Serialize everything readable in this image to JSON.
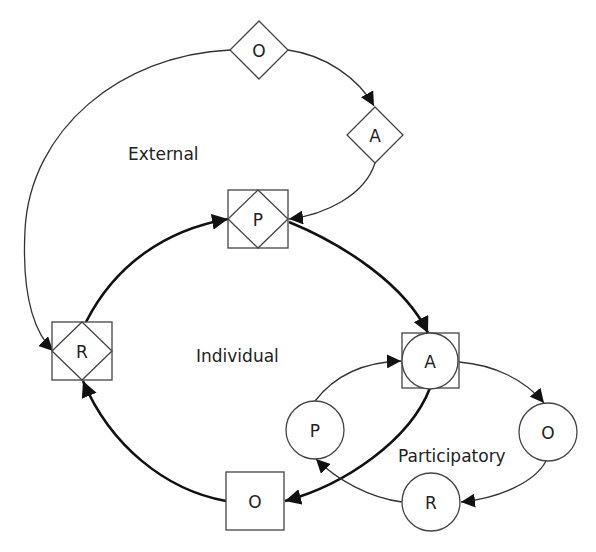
{
  "regions": {
    "external": "External",
    "individual": "Individual",
    "participatory": "Participatory"
  },
  "nodes": {
    "external_o": {
      "label": "O",
      "shape": "diamond",
      "loop": "external"
    },
    "external_a": {
      "label": "A",
      "shape": "diamond",
      "loop": "external"
    },
    "shared_p": {
      "label": "P",
      "shape": "square-with-diamond",
      "loop": "external+individual"
    },
    "shared_r": {
      "label": "R",
      "shape": "square-with-diamond",
      "loop": "external+individual"
    },
    "shared_a": {
      "label": "A",
      "shape": "square-with-circle",
      "loop": "individual+participatory"
    },
    "individual_o": {
      "label": "O",
      "shape": "square",
      "loop": "individual"
    },
    "participatory_p": {
      "label": "P",
      "shape": "circle",
      "loop": "participatory"
    },
    "participatory_o": {
      "label": "O",
      "shape": "circle",
      "loop": "participatory"
    },
    "participatory_r": {
      "label": "R",
      "shape": "circle",
      "loop": "participatory"
    }
  },
  "edges": [
    {
      "from": "external_o",
      "to": "external_a",
      "style": "thin"
    },
    {
      "from": "external_a",
      "to": "shared_p",
      "style": "thin"
    },
    {
      "from": "external_o",
      "to": "shared_r",
      "style": "thin"
    },
    {
      "from": "shared_p",
      "to": "shared_a",
      "style": "thick"
    },
    {
      "from": "shared_a",
      "to": "individual_o",
      "style": "thick"
    },
    {
      "from": "individual_o",
      "to": "shared_r",
      "style": "thick"
    },
    {
      "from": "shared_r",
      "to": "shared_p",
      "style": "thick"
    },
    {
      "from": "shared_a",
      "to": "participatory_o",
      "style": "thin"
    },
    {
      "from": "participatory_o",
      "to": "participatory_r",
      "style": "thin"
    },
    {
      "from": "participatory_r",
      "to": "participatory_p",
      "style": "thin"
    },
    {
      "from": "participatory_p",
      "to": "shared_a",
      "style": "thin"
    }
  ]
}
